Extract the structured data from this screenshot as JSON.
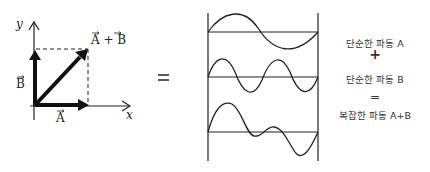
{
  "vector_diagram": {
    "y_axis_label": "y",
    "x_axis_label": "x",
    "vector_a_label": "A",
    "vector_b_label": "B",
    "sum_label": "A + B"
  },
  "equals_sign": "=",
  "waves": {
    "count": 3,
    "descriptions": [
      "simple wave A (1 cycle)",
      "simple wave B (2 cycles)",
      "complex wave A+B"
    ]
  },
  "legend": {
    "wave_a": "단순한 파동 A",
    "plus": "+",
    "wave_b": "단순한 파동 B",
    "equals": "=",
    "wave_sum": "복잡한 파동 A+B"
  },
  "colors": {
    "stroke": "#222222",
    "text": "#333333"
  }
}
